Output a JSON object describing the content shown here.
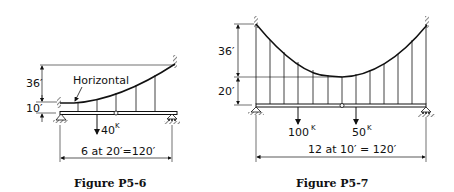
{
  "figures": [
    {
      "id": "p5-6",
      "caption": "Figure P5-6",
      "annotation": "Horizontal",
      "dims": {
        "sag": "36′",
        "offset": "10′",
        "span": "6 at 20′=120′"
      },
      "loads": [
        {
          "value": "40",
          "unit": "K"
        }
      ],
      "panels": 6,
      "panel_length_ft": 20,
      "span_ft": 120
    },
    {
      "id": "p5-7",
      "caption": "Figure P5-7",
      "dims": {
        "sag": "36′",
        "offset": "20′",
        "span": "12 at 10′ = 120′"
      },
      "loads": [
        {
          "value": "100",
          "unit": "K"
        },
        {
          "value": "50",
          "unit": "K"
        }
      ],
      "panels": 12,
      "panel_length_ft": 10,
      "span_ft": 120
    }
  ]
}
